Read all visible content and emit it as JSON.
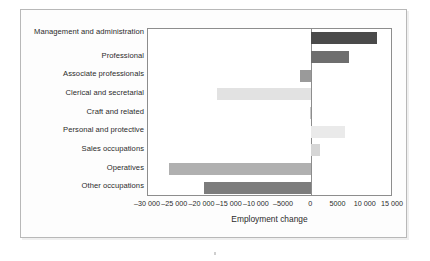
{
  "chart_data": {
    "type": "bar",
    "orientation": "horizontal",
    "title": "",
    "xlabel": "Employment change",
    "ylabel": "",
    "xlim": [
      -30000,
      15000
    ],
    "xticks": [
      -30000,
      -25000,
      -20000,
      -15000,
      -10000,
      -5000,
      0,
      5000,
      10000,
      15000
    ],
    "xticklabels": [
      "–30 000",
      "–25 000",
      "–20 000",
      "–15 000",
      "–10 000",
      "–5000",
      "0",
      "5000",
      "10 000",
      "15 000"
    ],
    "grid": false,
    "legend": null,
    "categories": [
      "Management and administration",
      "Professional",
      "Associate professionals",
      "Clerical and secretarial",
      "Craft and related",
      "Personal and protective",
      "Sales occupations",
      "Operatives",
      "Other occupations"
    ],
    "values": [
      12100,
      6900,
      -2000,
      -17300,
      -200,
      6200,
      1600,
      -26200,
      -19800
    ],
    "bar_colors": [
      "#4a4a4a",
      "#6e6e6e",
      "#9a9a9a",
      "#e2e2e2",
      "#c8c8c8",
      "#eaeaea",
      "#d6d6d6",
      "#b0b0b0",
      "#7c7c7c"
    ]
  },
  "chart": {
    "xlabel": "Employment change",
    "axis_color": "#8d8d8d",
    "plot_background": "#ffffff",
    "frame_color": "#b8b8b8"
  }
}
